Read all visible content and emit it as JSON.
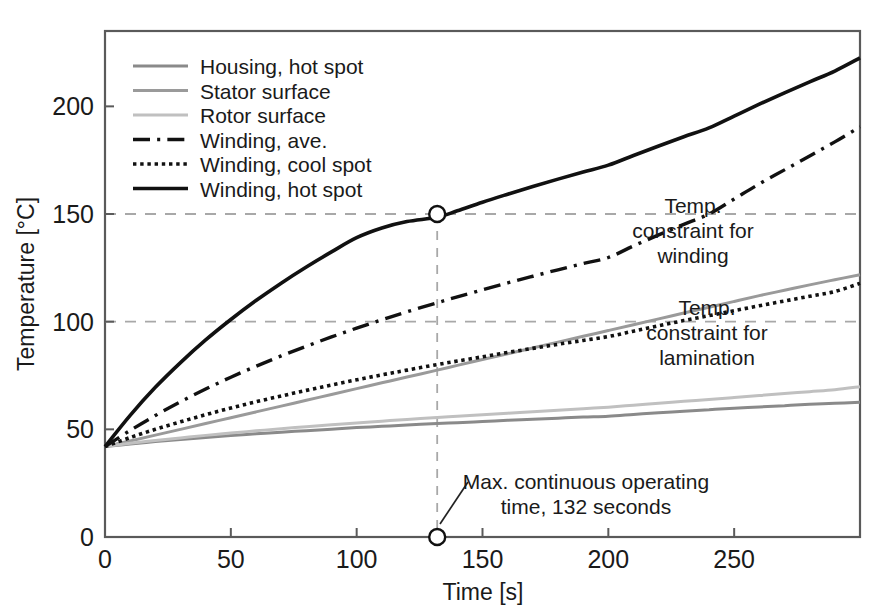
{
  "chart_data": {
    "type": "line",
    "title": "",
    "xlabel": "Time [s]",
    "ylabel": "Temperature [°C]",
    "xlim": [
      0,
      300
    ],
    "ylim": [
      0,
      235
    ],
    "xticks": [
      0,
      50,
      100,
      150,
      200,
      250
    ],
    "yticks": [
      0,
      50,
      100,
      150,
      200
    ],
    "xtick_labels": [
      "0",
      "50",
      "100",
      "150",
      "200",
      "250"
    ],
    "ytick_labels": [
      "0",
      "50",
      "100",
      "150",
      "200"
    ],
    "grid": false,
    "legend_position": "top-left",
    "x": [
      0,
      10,
      20,
      30,
      40,
      50,
      60,
      70,
      80,
      90,
      100,
      110,
      120,
      132,
      140,
      150,
      160,
      170,
      180,
      190,
      200,
      210,
      220,
      230,
      240,
      250,
      260,
      270,
      280,
      290,
      300
    ],
    "series": [
      {
        "name": "Housing, hot spot",
        "color": "#8a8a8a",
        "style": "solid",
        "width": 3.0,
        "values": [
          42,
          43.2,
          44.3,
          45.3,
          46.2,
          47.1,
          47.9,
          48.7,
          49.4,
          50.1,
          50.8,
          51.4,
          52.0,
          52.7,
          53.1,
          53.6,
          54.2,
          54.7,
          55.2,
          55.7,
          56.1,
          56.9,
          57.7,
          58.4,
          59.1,
          59.8,
          60.4,
          61.0,
          61.6,
          62.1,
          62.6
        ]
      },
      {
        "name": "Stator surface",
        "color": "#9a9a9a",
        "style": "solid",
        "width": 3.0,
        "values": [
          42,
          44.6,
          47.3,
          50.0,
          52.7,
          55.4,
          58.1,
          60.8,
          63.5,
          66.2,
          68.9,
          71.6,
          74.3,
          77.5,
          79.7,
          82.4,
          85.1,
          87.8,
          90.5,
          93.2,
          95.9,
          98.6,
          101.3,
          104.0,
          106.7,
          109.4,
          112.1,
          114.6,
          117.1,
          119.5,
          121.8
        ]
      },
      {
        "name": "Rotor surface",
        "color": "#c0c0c0",
        "style": "solid",
        "width": 3.0,
        "values": [
          42,
          43.5,
          44.8,
          46.0,
          47.2,
          48.3,
          49.3,
          50.3,
          51.2,
          52.1,
          53.0,
          53.8,
          54.6,
          55.5,
          56.1,
          56.8,
          57.5,
          58.2,
          58.9,
          59.6,
          60.3,
          61.2,
          62.1,
          63.0,
          63.9,
          64.8,
          65.7,
          66.6,
          67.5,
          68.4,
          69.8
        ]
      },
      {
        "name": "Winding, ave.",
        "color": "#111111",
        "style": "dashdot",
        "width": 3.4,
        "values": [
          42,
          49.5,
          56.4,
          62.8,
          68.7,
          74.2,
          79.3,
          84.1,
          88.6,
          92.9,
          97.0,
          100.9,
          104.6,
          108.8,
          111.5,
          114.8,
          118.0,
          121.1,
          124.1,
          127.0,
          129.8,
          135.2,
          140.3,
          145.2,
          150.0,
          157.0,
          164.0,
          170.5,
          177.0,
          183.5,
          190.5
        ]
      },
      {
        "name": "Winding, cool spot",
        "color": "#111111",
        "style": "dotted",
        "width": 3.6,
        "values": [
          42,
          46.2,
          50.0,
          53.5,
          56.8,
          59.9,
          62.8,
          65.5,
          68.1,
          70.6,
          73.0,
          75.3,
          77.5,
          80.1,
          81.7,
          83.7,
          85.7,
          87.6,
          89.5,
          91.3,
          93.1,
          95.6,
          98.1,
          100.5,
          102.8,
          105.1,
          107.4,
          109.6,
          111.8,
          114.0,
          117.8
        ]
      },
      {
        "name": "Winding, hot spot",
        "color": "#111111",
        "style": "solid",
        "width": 3.6,
        "values": [
          42,
          56.5,
          69.5,
          81.0,
          91.5,
          101.0,
          109.8,
          117.9,
          125.4,
          132.4,
          139.0,
          143.5,
          146.5,
          148.5,
          151.5,
          155.5,
          159.2,
          162.8,
          166.2,
          169.5,
          172.7,
          177.2,
          181.6,
          185.9,
          190.0,
          195.5,
          201.0,
          206.3,
          211.4,
          216.4,
          222.5
        ]
      }
    ],
    "constraint_lines": [
      {
        "name": "winding",
        "value": 150,
        "label": "Temp.\nconstraint for\nwinding"
      },
      {
        "name": "lamination",
        "value": 100,
        "label": "Temp.\nconstraint for\nlamination"
      }
    ],
    "markers": [
      {
        "name": "operating-time-intersection",
        "x": 132,
        "y": 150
      },
      {
        "name": "operating-time-axis",
        "x": 132,
        "y": 0
      }
    ],
    "annotations": [
      {
        "name": "max-operating-time",
        "lines": [
          "Max. continuous operating",
          "time, 132 seconds"
        ]
      }
    ]
  },
  "axes": {
    "x_title": "Time [s]",
    "y_title": "Temperature [°C]",
    "x_ticks": [
      "0",
      "50",
      "100",
      "150",
      "200",
      "250"
    ],
    "y_ticks": [
      "0",
      "50",
      "100",
      "150",
      "200"
    ]
  },
  "legend": {
    "items": [
      {
        "label": "Housing, hot spot"
      },
      {
        "label": "Stator surface"
      },
      {
        "label": "Rotor surface"
      },
      {
        "label": "Winding, ave."
      },
      {
        "label": "Winding, cool spot"
      },
      {
        "label": "Winding, hot spot"
      }
    ]
  },
  "annotations": {
    "winding_constraint": {
      "line1": "Temp.",
      "line2": "constraint for",
      "line3": "winding"
    },
    "lamination_constraint": {
      "line1": "Temp.",
      "line2": "constraint for",
      "line3": "lamination"
    },
    "operating_time": {
      "line1": "Max. continuous operating",
      "line2": "time, 132 seconds"
    }
  }
}
